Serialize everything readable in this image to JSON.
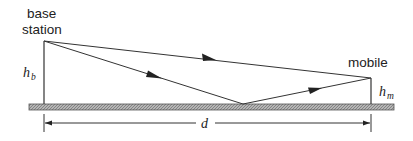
{
  "labels": {
    "base_station_line1": "base",
    "base_station_line2": "station",
    "mobile": "mobile",
    "hb_main": "h",
    "hb_sub": "b",
    "hm_main": "h",
    "hm_sub": "m",
    "distance": "d"
  },
  "colors": {
    "line": "#333333",
    "ground_fill": "#9a9a9a",
    "ground_stroke": "#555555"
  },
  "geometry": {
    "base_tower": {
      "x": 44,
      "top": 41,
      "bottom": 104
    },
    "mobile_tower": {
      "x": 371,
      "top": 78,
      "bottom": 104
    },
    "ground": {
      "x1": 29,
      "x2": 394,
      "y": 104,
      "height": 6
    },
    "reflection_point": {
      "x": 243,
      "y": 104
    },
    "dimension_line": {
      "y": 123,
      "x1": 44,
      "x2": 371
    }
  }
}
